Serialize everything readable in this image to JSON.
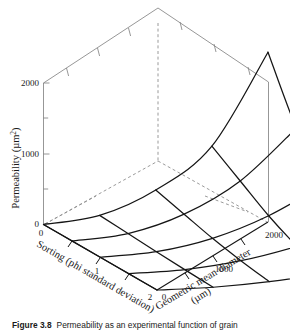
{
  "figure": {
    "caption_label": "Figure 3.8",
    "caption_text": "Permeability as an experimental function of grain"
  },
  "chart_data": {
    "type": "surface",
    "title": "",
    "projection": "3d-wireframe-mesh",
    "zlabel": "Permeability (µm²)",
    "zlabel_text": "Permeability",
    "zlabel_units": "(µm²)",
    "zlim": [
      0,
      2000
    ],
    "z_ticks": [
      0,
      1000,
      2000
    ],
    "z_tick_labels": [
      "0",
      "1000",
      "2000"
    ],
    "z_minor_ticks": [
      500,
      1500
    ],
    "xlabel": "Sorting (phi standard deviation)",
    "xlabel_line1": "Sorting (phi standard deviation)",
    "xlim": [
      0,
      2
    ],
    "x_ticks": [
      0,
      1,
      2
    ],
    "x_tick_labels": [
      "0",
      "1",
      "2"
    ],
    "ylabel": "Geometric mean diameter (µm)",
    "ylabel_line1": "Geometric mean diameter",
    "ylabel_line2": "(µm)",
    "ylim": [
      0,
      2000
    ],
    "y_ticks": [
      0,
      1000,
      2000
    ],
    "y_tick_labels": [
      "0",
      "1000",
      "2000"
    ],
    "grid": false,
    "legend": "none",
    "x_values_sorting": [
      0,
      0.5,
      1.0,
      1.5,
      2.0
    ],
    "y_values_diameter": [
      0,
      500,
      1000,
      1500,
      2000
    ],
    "z_surface_permeability": [
      [
        0,
        120,
        470,
        1080,
        2400
      ],
      [
        0,
        95,
        360,
        820,
        1560
      ],
      [
        0,
        70,
        250,
        560,
        1000
      ],
      [
        0,
        48,
        165,
        360,
        620
      ],
      [
        0,
        30,
        100,
        210,
        360
      ]
    ],
    "surface_note": "rows = sorting 0..2, columns = geometric mean diameter 0..2000",
    "peak_value": 2400,
    "peak_at": {
      "sorting": 0,
      "diameter": 2000
    }
  }
}
